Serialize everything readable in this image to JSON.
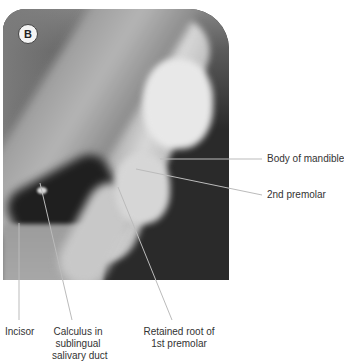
{
  "figure": {
    "panel_label": "B",
    "image_type": "dental radiograph",
    "labels": {
      "body_of_mandible": "Body of mandible",
      "second_premolar": "2nd premolar",
      "incisor": "Incisor",
      "calculus_line1": "Calculus in",
      "calculus_line2": "sublingual",
      "calculus_line3": "salivary duct",
      "retained_root_line1": "Retained root of",
      "retained_root_line2": "1st premolar"
    }
  }
}
